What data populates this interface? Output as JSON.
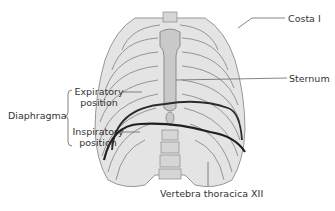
{
  "figure": {
    "labels": {
      "costa": "Costa I",
      "sternum": "Sternum",
      "diaphragma": "Diaphragma",
      "expiratory_line1": "Expiratory",
      "expiratory_line2": "position",
      "inspiratory_line1": "Inspiratory",
      "inspiratory_line2": "position",
      "vertebra": "Vertebra thoracica XII"
    },
    "colors": {
      "bone_fill": "#dcdcdc",
      "bone_stroke": "#7a7a7a",
      "cartilage": "#bdbdbd",
      "diaphragm_line": "#2b2b2b",
      "leader_line": "#666666",
      "text": "#333333"
    }
  }
}
